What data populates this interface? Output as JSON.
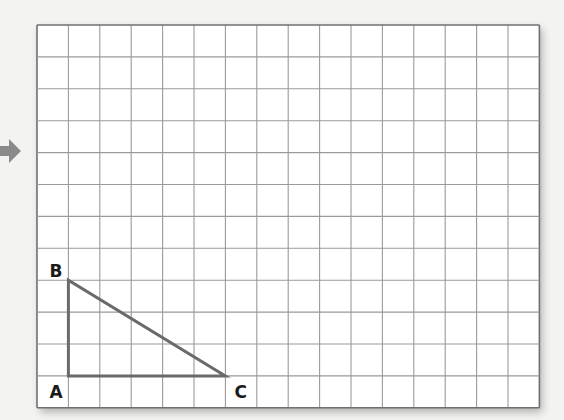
{
  "grid": {
    "columns": 16,
    "rows": 12,
    "origin_x": 37,
    "origin_y": 25,
    "cell_width": 31.4,
    "cell_height": 31.9,
    "line_color": "#9a9a9a",
    "border_color": "#707070",
    "background": "#ffffff"
  },
  "triangle": {
    "stroke_color": "#6a6a6a",
    "stroke_width": 3,
    "vertices": {
      "A": {
        "col": 1,
        "row": 11
      },
      "B": {
        "col": 1,
        "row": 8
      },
      "C": {
        "col": 6,
        "row": 11
      }
    }
  },
  "labels": {
    "A": "A",
    "B": "B",
    "C": "C"
  },
  "arrow": {
    "direction": "right",
    "color": "#8a8a8a"
  }
}
